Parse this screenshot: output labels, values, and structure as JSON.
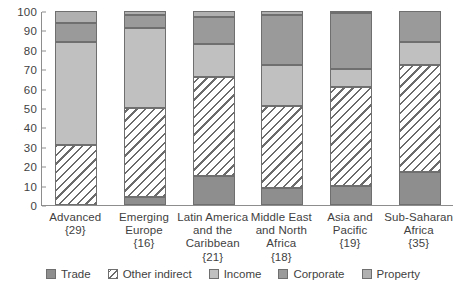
{
  "chart_data": {
    "type": "bar",
    "subtype": "stacked-bar-100",
    "title": "",
    "xlabel": "",
    "ylabel": "",
    "ylim": [
      0,
      100
    ],
    "yticks": [
      0,
      10,
      20,
      30,
      40,
      50,
      60,
      70,
      80,
      90,
      100
    ],
    "ytick_labels": [
      "0",
      "10",
      "20",
      "30",
      "40",
      "50",
      "60",
      "70",
      "80",
      "90",
      "100"
    ],
    "grid": false,
    "legend_position": "bottom",
    "categories": [
      "Advanced {29}",
      "Emerging Europe {16}",
      "Latin America and the Caribbean {21}",
      "Middle East and North Africa {18}",
      "Asia and Pacific {19}",
      "Sub-Saharan Africa {35}"
    ],
    "category_lines": [
      [
        "Advanced",
        "{29}"
      ],
      [
        "Emerging",
        "Europe",
        "{16}"
      ],
      [
        "Latin America",
        "and the",
        "Caribbean",
        "{21}"
      ],
      [
        "Middle East",
        "and North",
        "Africa",
        "{18}"
      ],
      [
        "Asia and",
        "Pacific",
        "{19}"
      ],
      [
        "Sub-Saharan",
        "Africa",
        "{35}"
      ]
    ],
    "series": [
      {
        "name": "Trade",
        "key": "trade",
        "color": "#8e8e8e",
        "pattern": "solid",
        "values": [
          0,
          4,
          15,
          9,
          10,
          17
        ]
      },
      {
        "name": "Other indirect",
        "key": "other-indirect",
        "color": "#ffffff",
        "pattern": "hatched",
        "values": [
          31,
          46,
          51,
          42,
          51,
          55
        ]
      },
      {
        "name": "Income",
        "key": "income",
        "color": "#c0c0c0",
        "pattern": "solid",
        "values": [
          53,
          41,
          17,
          21,
          9,
          12
        ]
      },
      {
        "name": "Corporate",
        "key": "corporate",
        "color": "#9a9a9a",
        "pattern": "solid",
        "values": [
          10,
          7,
          14,
          26,
          29,
          16
        ]
      },
      {
        "name": "Property",
        "key": "property",
        "color": "#b0b0b0",
        "pattern": "solid",
        "values": [
          6,
          2,
          3,
          2,
          1,
          0
        ]
      }
    ],
    "cumulative_tops": [
      {
        "category": "Advanced {29}",
        "trade": 0,
        "other_indirect": 31,
        "income": 84,
        "corporate": 94,
        "property": 100
      },
      {
        "category": "Emerging Europe {16}",
        "trade": 4,
        "other_indirect": 50,
        "income": 91,
        "corporate": 98,
        "property": 100
      },
      {
        "category": "Latin America and the Caribbean {21}",
        "trade": 15,
        "other_indirect": 66,
        "income": 83,
        "corporate": 97,
        "property": 100
      },
      {
        "category": "Middle East and North Africa {18}",
        "trade": 9,
        "other_indirect": 51,
        "income": 72,
        "corporate": 98,
        "property": 100
      },
      {
        "category": "Asia and Pacific {19}",
        "trade": 10,
        "other_indirect": 61,
        "income": 70,
        "corporate": 99,
        "property": 100
      },
      {
        "category": "Sub-Saharan Africa {35}",
        "trade": 17,
        "other_indirect": 72,
        "income": 84,
        "corporate": 100,
        "property": 100
      }
    ]
  },
  "legend": {
    "items": [
      {
        "label": "Trade",
        "key": "trade"
      },
      {
        "label": "Other indirect",
        "key": "other-indirect"
      },
      {
        "label": "Income",
        "key": "income"
      },
      {
        "label": "Corporate",
        "key": "corporate"
      },
      {
        "label": "Property",
        "key": "property"
      }
    ]
  },
  "colors": {
    "trade": "#8e8e8e",
    "other_indirect": "#ffffff",
    "income": "#c0c0c0",
    "corporate": "#9a9a9a",
    "property": "#b0b0b0",
    "axis": "#8d8d8d",
    "text": "#3f3f3f"
  }
}
